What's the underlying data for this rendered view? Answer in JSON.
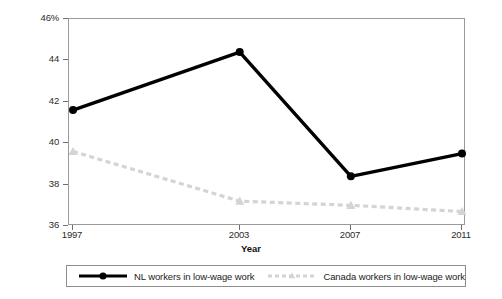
{
  "chart_data": {
    "type": "line",
    "title": "",
    "subtitle": "",
    "xlabel": "Year",
    "ylabel": "% Total Employed",
    "categories": [
      "1997",
      "2003",
      "2007",
      "2011"
    ],
    "x": [
      1997,
      2003,
      2007,
      2011
    ],
    "xlim": [
      1997,
      2011
    ],
    "ylim": [
      36,
      46
    ],
    "grid": false,
    "legend_position": "bottom",
    "y_ticks": [
      {
        "value": 36,
        "label": "36"
      },
      {
        "value": 38,
        "label": "38"
      },
      {
        "value": 40,
        "label": "40"
      },
      {
        "value": 42,
        "label": "42"
      },
      {
        "value": 44,
        "label": "44"
      },
      {
        "value": 46,
        "label": "46%"
      }
    ],
    "x_ticks": [
      {
        "value": 1997,
        "label": "1997"
      },
      {
        "value": 2003,
        "label": "2003"
      },
      {
        "value": 2007,
        "label": "2007"
      },
      {
        "value": 2011,
        "label": "2011"
      }
    ],
    "series": [
      {
        "name": "NL workers in low-wage work",
        "values": [
          41.6,
          44.4,
          38.4,
          39.5
        ],
        "color": "#000000",
        "style": "solid",
        "marker": "circle"
      },
      {
        "name": "Canada workers in low-wage work",
        "values": [
          39.6,
          37.2,
          37.0,
          36.7
        ],
        "color": "#d4d4d4",
        "style": "dashed",
        "marker": "triangle"
      }
    ]
  },
  "legend": {
    "entries": [
      {
        "label": "NL workers in low-wage work"
      },
      {
        "label": "Canada workers in low-wage work"
      }
    ]
  }
}
